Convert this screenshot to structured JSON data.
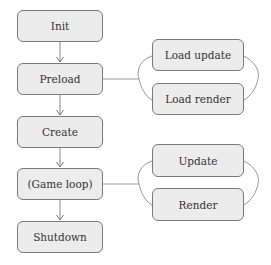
{
  "diagram": {
    "type": "flowchart",
    "colors": {
      "box_fill": "#ececec",
      "box_border": "#7a7a7a",
      "line": "#888888",
      "text": "#333333"
    },
    "main_flow": [
      {
        "id": "init",
        "label": "Init"
      },
      {
        "id": "preload",
        "label": "Preload"
      },
      {
        "id": "create",
        "label": "Create"
      },
      {
        "id": "game_loop",
        "label": "(Game loop)"
      },
      {
        "id": "shutdown",
        "label": "Shutdown"
      }
    ],
    "branches": {
      "preload": [
        {
          "id": "load_update",
          "label": "Load update"
        },
        {
          "id": "load_render",
          "label": "Load render"
        }
      ],
      "game_loop": [
        {
          "id": "update",
          "label": "Update"
        },
        {
          "id": "render",
          "label": "Render"
        }
      ]
    }
  }
}
